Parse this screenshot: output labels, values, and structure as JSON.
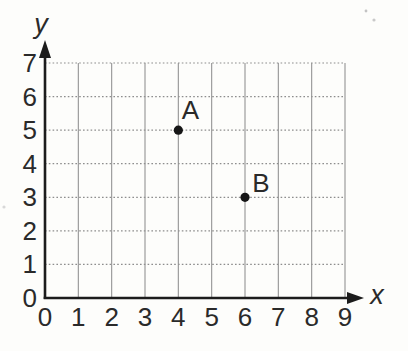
{
  "chart_data": {
    "type": "scatter",
    "title": "",
    "xlabel": "x",
    "ylabel": "y",
    "xlim": [
      0,
      9
    ],
    "ylim": [
      0,
      7
    ],
    "x_ticks": [
      0,
      1,
      2,
      3,
      4,
      5,
      6,
      7,
      8,
      9
    ],
    "y_ticks": [
      0,
      1,
      2,
      3,
      4,
      5,
      6,
      7
    ],
    "grid": true,
    "legend": false,
    "points": [
      {
        "label": "A",
        "x": 4,
        "y": 5,
        "label_dx": 12,
        "label_dy": -11
      },
      {
        "label": "B",
        "x": 6,
        "y": 3,
        "label_dx": 16,
        "label_dy": -5
      }
    ],
    "colors": {
      "background": "#fdfdfb",
      "axis": "#1c1c1c",
      "grid_vertical": "#949494",
      "grid_horizontal": "#8d8d8d",
      "point": "#161616",
      "text": "#2a2a2a"
    }
  }
}
